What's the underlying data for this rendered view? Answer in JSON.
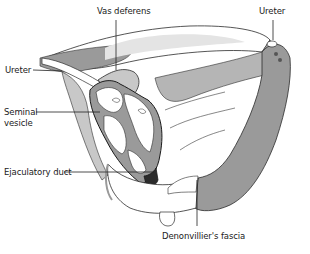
{
  "figure": {
    "type": "anatomical illustration",
    "colors": {
      "background": "#ffffff",
      "outline": "#2b2b2b",
      "shade": "#9a9a9a",
      "light_shade": "#c8c8c8",
      "leader_line": "#222222"
    }
  },
  "labels": [
    {
      "id": "vas-deferens",
      "text": "Vas deferens",
      "x": 97,
      "y": 11
    },
    {
      "id": "ureter-right",
      "text": "Ureter",
      "x": 261,
      "y": 11
    },
    {
      "id": "ureter-left",
      "text": "Ureter",
      "x": 5,
      "y": 66
    },
    {
      "id": "seminal-vesicle-line1",
      "text": "Seminal",
      "x": 4,
      "y": 108
    },
    {
      "id": "seminal-vesicle-line2",
      "text": "vesicle",
      "x": 4,
      "y": 119
    },
    {
      "id": "ejaculatory-duct",
      "text": "Ejaculatory duct",
      "x": 4,
      "y": 168
    },
    {
      "id": "denonvilliers-fascia",
      "text": "Denonvillier's fascia",
      "x": 164,
      "y": 236
    }
  ]
}
